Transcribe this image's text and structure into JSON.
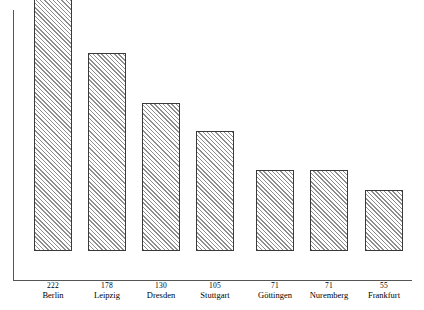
{
  "chart_data": {
    "type": "bar",
    "title": "",
    "subtitle": "",
    "xlabel": "",
    "ylabel": "",
    "categories": [
      "Berlin",
      "Leipzig",
      "Dresden",
      "Stuttgart",
      "Göttingen",
      "Nuremberg",
      "Frankfurt"
    ],
    "values": [
      222,
      178,
      130,
      105,
      71,
      71,
      55
    ],
    "value_labels": [
      "222",
      "178",
      "130",
      "105",
      "71",
      "71",
      "55"
    ],
    "ylim": [
      0,
      222
    ],
    "grid": false,
    "legend": null,
    "bar_fill": "diagonal-hatch",
    "bar_outline_color": "#3a3a3a",
    "hatch_color": "#8e8e8e",
    "axis_color": "#555555",
    "background_color": "#ffffff",
    "bars": [
      {
        "name": "Berlin",
        "value": 222,
        "value_label": "222",
        "left": 34,
        "width": 38,
        "top": 25
      },
      {
        "name": "Leipzig",
        "value": 178,
        "value_label": "178",
        "left": 88,
        "width": 38,
        "top": 82
      },
      {
        "name": "Dresden",
        "value": 130,
        "value_label": "130",
        "left": 142,
        "width": 38,
        "top": 132
      },
      {
        "name": "Stuttgart",
        "value": 105,
        "value_label": "105",
        "left": 196,
        "width": 38,
        "top": 160
      },
      {
        "name": "Göttingen",
        "value": 71,
        "value_label": "71",
        "left": 256,
        "width": 38,
        "top": 199
      },
      {
        "name": "Nuremberg",
        "value": 71,
        "value_label": "71",
        "left": 310,
        "width": 38,
        "top": 199
      },
      {
        "name": "Frankfurt",
        "value": 55,
        "value_label": "55",
        "left": 365,
        "width": 38,
        "top": 219
      }
    ]
  }
}
